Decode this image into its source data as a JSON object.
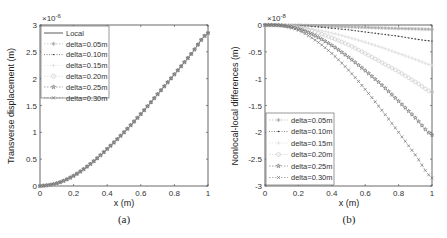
{
  "figure": {
    "panels": [
      {
        "id": "a",
        "caption": "(a)",
        "xlabel": "x (m)",
        "ylabel": "Transverse displacement (m)",
        "exponent": "×10",
        "exponent_power": "-6",
        "xticks": [
          "0",
          "0.2",
          "0.4",
          "0.6",
          "0.8",
          "1"
        ],
        "yticks": [
          "0",
          "0.5",
          "1",
          "1.5",
          "2",
          "2.5",
          "3"
        ]
      },
      {
        "id": "b",
        "caption": "(b)",
        "xlabel": "x (m)",
        "ylabel": "Nonlocal-local differences (m)",
        "exponent": "×10",
        "exponent_power": "-8",
        "xticks": [
          "0",
          "0.2",
          "0.4",
          "0.6",
          "0.8",
          "1"
        ],
        "yticks": [
          "0",
          "-0.5",
          "-1",
          "-1.5",
          "-2",
          "-2.5",
          "-3"
        ]
      }
    ],
    "legend_a": [
      "Local",
      "delta=0.05m",
      "delta=0.10m",
      "delta=0.15m",
      "delta=0.20m",
      "delta=0.25m",
      "delta=0.30m"
    ],
    "legend_b": [
      "delta=0.05m",
      "delta=0.10m",
      "delta=0.15m",
      "delta=0.20m",
      "delta=0.25m",
      "delta=0.30m"
    ]
  },
  "chart_data": [
    {
      "type": "line",
      "title": "(a)",
      "xlabel": "x (m)",
      "ylabel": "Transverse displacement (m)",
      "y_scale_factor": "1e-6",
      "xlim": [
        0,
        1
      ],
      "ylim": [
        0,
        3
      ],
      "grid": false,
      "legend_position": "upper left",
      "x": [
        0,
        0.1,
        0.2,
        0.3,
        0.4,
        0.5,
        0.6,
        0.7,
        0.8,
        0.9,
        1.0
      ],
      "series": [
        {
          "name": "Local",
          "values": [
            0,
            0.05,
            0.19,
            0.41,
            0.69,
            1.0,
            1.34,
            1.71,
            2.08,
            2.46,
            2.85
          ]
        },
        {
          "name": "delta=0.05m",
          "values": [
            0,
            0.05,
            0.19,
            0.41,
            0.69,
            1.0,
            1.34,
            1.71,
            2.08,
            2.46,
            2.85
          ]
        },
        {
          "name": "delta=0.10m",
          "values": [
            0,
            0.05,
            0.19,
            0.41,
            0.69,
            1.0,
            1.34,
            1.71,
            2.08,
            2.46,
            2.85
          ]
        },
        {
          "name": "delta=0.15m",
          "values": [
            0,
            0.05,
            0.19,
            0.41,
            0.69,
            1.0,
            1.34,
            1.71,
            2.08,
            2.46,
            2.85
          ]
        },
        {
          "name": "delta=0.20m",
          "values": [
            0,
            0.05,
            0.19,
            0.41,
            0.69,
            1.0,
            1.34,
            1.71,
            2.08,
            2.46,
            2.85
          ]
        },
        {
          "name": "delta=0.25m",
          "values": [
            0,
            0.05,
            0.19,
            0.41,
            0.69,
            1.0,
            1.34,
            1.71,
            2.08,
            2.46,
            2.85
          ]
        },
        {
          "name": "delta=0.30m",
          "values": [
            0,
            0.05,
            0.19,
            0.41,
            0.69,
            1.0,
            1.34,
            1.71,
            2.08,
            2.46,
            2.85
          ]
        }
      ]
    },
    {
      "type": "line",
      "title": "(b)",
      "xlabel": "x (m)",
      "ylabel": "Nonlocal-local differences (m)",
      "y_scale_factor": "1e-8",
      "xlim": [
        0,
        1
      ],
      "ylim": [
        -3,
        0
      ],
      "grid": false,
      "legend_position": "lower left",
      "x": [
        0,
        0.1,
        0.2,
        0.3,
        0.4,
        0.5,
        0.6,
        0.7,
        0.8,
        0.9,
        1.0
      ],
      "series": [
        {
          "name": "delta=0.05m",
          "values": [
            0,
            0,
            -0.005,
            -0.015,
            -0.025,
            -0.035,
            -0.045,
            -0.055,
            -0.065,
            -0.072,
            -0.08
          ]
        },
        {
          "name": "delta=0.10m",
          "values": [
            0,
            0,
            -0.01,
            -0.03,
            -0.06,
            -0.09,
            -0.13,
            -0.17,
            -0.21,
            -0.26,
            -0.3
          ]
        },
        {
          "name": "delta=0.15m",
          "values": [
            0,
            0,
            -0.03,
            -0.08,
            -0.15,
            -0.23,
            -0.32,
            -0.42,
            -0.53,
            -0.64,
            -0.75
          ]
        },
        {
          "name": "delta=0.20m",
          "values": [
            0,
            -0.01,
            -0.05,
            -0.13,
            -0.24,
            -0.37,
            -0.53,
            -0.7,
            -0.87,
            -1.06,
            -1.25
          ]
        },
        {
          "name": "delta=0.25m",
          "values": [
            0,
            -0.01,
            -0.07,
            -0.2,
            -0.38,
            -0.6,
            -0.85,
            -1.12,
            -1.42,
            -1.73,
            -2.05
          ]
        },
        {
          "name": "delta=0.30m",
          "values": [
            0,
            -0.01,
            -0.1,
            -0.28,
            -0.53,
            -0.84,
            -1.2,
            -1.59,
            -2.0,
            -2.42,
            -2.85
          ]
        }
      ]
    }
  ]
}
